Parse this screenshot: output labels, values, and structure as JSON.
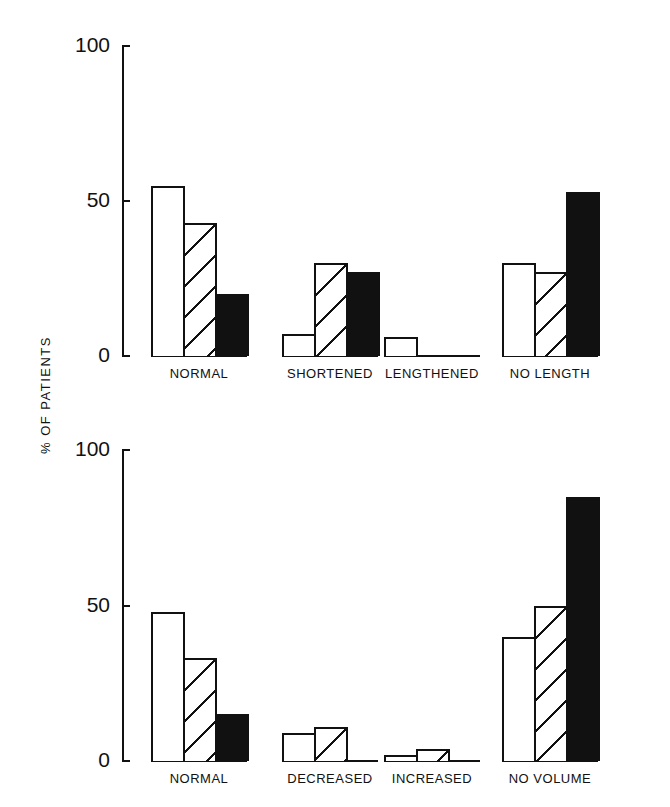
{
  "figure": {
    "ylabel": "% OF PATIENTS"
  },
  "chart_data": [
    {
      "type": "bar",
      "title": "",
      "xlabel": "",
      "ylabel": "% OF PATIENTS",
      "ylim": [
        0,
        100
      ],
      "yticks": [
        0,
        50,
        100
      ],
      "categories": [
        "NORMAL",
        "SHORTENED",
        "LENGTHENED",
        "NO LENGTH"
      ],
      "series": [
        {
          "name": "Group 1 (open)",
          "pattern": "open",
          "values": [
            55,
            7,
            6,
            30
          ]
        },
        {
          "name": "Group 2 (hatched)",
          "pattern": "hatched",
          "values": [
            43,
            30,
            0,
            27
          ]
        },
        {
          "name": "Group 3 (solid)",
          "pattern": "solid",
          "values": [
            20,
            27,
            0,
            53
          ]
        }
      ],
      "grid": false,
      "legend": null
    },
    {
      "type": "bar",
      "title": "",
      "xlabel": "",
      "ylabel": "% OF PATIENTS",
      "ylim": [
        0,
        100
      ],
      "yticks": [
        0,
        50,
        100
      ],
      "categories": [
        "NORMAL",
        "DECREASED",
        "INCREASED",
        "NO VOLUME"
      ],
      "series": [
        {
          "name": "Group 1 (open)",
          "pattern": "open",
          "values": [
            48,
            9,
            2,
            40
          ]
        },
        {
          "name": "Group 2 (hatched)",
          "pattern": "hatched",
          "values": [
            33,
            11,
            4,
            50
          ]
        },
        {
          "name": "Group 3 (solid)",
          "pattern": "solid",
          "values": [
            15,
            0,
            0,
            85
          ]
        }
      ],
      "grid": false,
      "legend": null
    }
  ]
}
